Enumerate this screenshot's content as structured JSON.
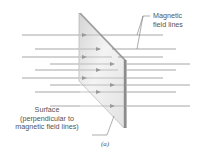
{
  "diagram": {
    "labels": {
      "field_lines_1": "Magnetic",
      "field_lines_2": "field lines",
      "surface_1": "Surface",
      "surface_2": "(perpendicular to",
      "surface_3": "magnetic field lines)",
      "caption": "(a)"
    },
    "colors": {
      "field_line": "#8a8a8a",
      "plate_light": "#f2f2f2",
      "plate_dark": "#bdbdbd",
      "plate_edge": "#8c8c8c",
      "text": "#555555"
    },
    "field_lines_y": [
      35,
      49,
      57,
      64,
      70,
      78,
      85,
      92,
      106
    ]
  }
}
